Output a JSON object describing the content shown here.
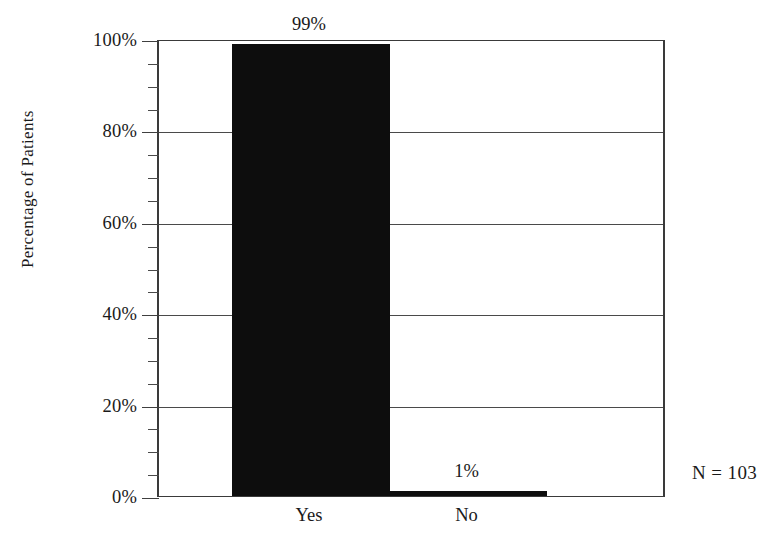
{
  "chart_data": {
    "type": "bar",
    "title": "",
    "subtitle": "",
    "xlabel": "",
    "ylabel": "Percentage of Patients",
    "categories": [
      "Yes",
      "No"
    ],
    "values": [
      99,
      1
    ],
    "value_labels": [
      "99%",
      "1%"
    ],
    "ylim": [
      0,
      100
    ],
    "ytick_labels": [
      "0%",
      "20%",
      "40%",
      "60%",
      "80%",
      "100%"
    ],
    "ytick_values": [
      0,
      20,
      40,
      60,
      80,
      100
    ],
    "minor_ticks_between_majors": 3,
    "minor_tick_step": 5,
    "grid": true,
    "grid_axis": "y",
    "legend": false,
    "legend_position": "none",
    "bar_color": "#0d0d0d",
    "axis_color": "#3a3a3a",
    "background_color": "#ffffff",
    "annotations": [
      {
        "name": "sample-size",
        "text": "N = 103"
      }
    ]
  }
}
